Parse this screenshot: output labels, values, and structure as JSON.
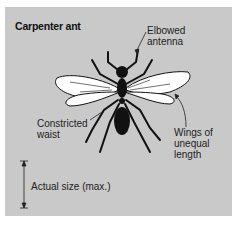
{
  "diagram": {
    "title": "Carpenter ant",
    "labels": {
      "antenna": [
        "Elbowed",
        "antenna"
      ],
      "waist": [
        "Constricted",
        "waist"
      ],
      "wings": [
        "Wings of",
        "unequal",
        "length"
      ],
      "size": "Actual size (max.)"
    },
    "colors": {
      "panel": "#c9c9c9",
      "ant": "#111111",
      "wing_fill": "#ffffff"
    }
  }
}
